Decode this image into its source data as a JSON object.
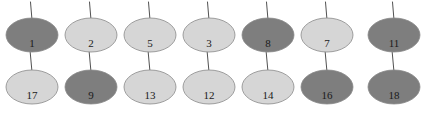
{
  "diagram": {
    "type": "node-graph",
    "canvas": {
      "width": 427,
      "height": 114,
      "background": "#ffffff"
    },
    "colors": {
      "dark_fill": "#7e7e7e",
      "light_fill": "#d6d6d6",
      "node_stroke": "#8a8a8a",
      "edge_stroke": "#3d3d3d",
      "label_color": "#1a1a1a"
    },
    "geometry": {
      "node_rx": 26,
      "node_ry": 17,
      "column_x": [
        32,
        91,
        150,
        209,
        268,
        327,
        394
      ],
      "row_cy": [
        35,
        87
      ]
    },
    "rows": [
      {
        "row_index": 0,
        "nodes": [
          {
            "label": "1",
            "shade": "dark",
            "fill": "#7e7e7e",
            "cx": 32,
            "cy": 35
          },
          {
            "label": "2",
            "shade": "light",
            "fill": "#d6d6d6",
            "cx": 91,
            "cy": 35
          },
          {
            "label": "5",
            "shade": "light",
            "fill": "#d6d6d6",
            "cx": 150,
            "cy": 35
          },
          {
            "label": "3",
            "shade": "light",
            "fill": "#d6d6d6",
            "cx": 209,
            "cy": 35
          },
          {
            "label": "8",
            "shade": "dark",
            "fill": "#7e7e7e",
            "cx": 268,
            "cy": 35
          },
          {
            "label": "7",
            "shade": "light",
            "fill": "#d6d6d6",
            "cx": 327,
            "cy": 35
          },
          {
            "label": "11",
            "shade": "dark",
            "fill": "#7e7e7e",
            "cx": 394,
            "cy": 35
          }
        ]
      },
      {
        "row_index": 1,
        "nodes": [
          {
            "label": "17",
            "shade": "light",
            "fill": "#d6d6d6",
            "cx": 32,
            "cy": 87
          },
          {
            "label": "9",
            "shade": "dark",
            "fill": "#7e7e7e",
            "cx": 91,
            "cy": 87
          },
          {
            "label": "13",
            "shade": "light",
            "fill": "#d6d6d6",
            "cx": 150,
            "cy": 87
          },
          {
            "label": "12",
            "shade": "light",
            "fill": "#d6d6d6",
            "cx": 209,
            "cy": 87
          },
          {
            "label": "14",
            "shade": "light",
            "fill": "#d6d6d6",
            "cx": 268,
            "cy": 87
          },
          {
            "label": "16",
            "shade": "dark",
            "fill": "#7e7e7e",
            "cx": 327,
            "cy": 87
          },
          {
            "label": "18",
            "shade": "dark",
            "fill": "#7e7e7e",
            "cx": 394,
            "cy": 87
          }
        ]
      }
    ],
    "edges": [
      {
        "from": "incoming",
        "to": "1",
        "kind": "top-stub"
      },
      {
        "from": "incoming",
        "to": "2",
        "kind": "top-stub"
      },
      {
        "from": "incoming",
        "to": "5",
        "kind": "top-stub"
      },
      {
        "from": "incoming",
        "to": "3",
        "kind": "top-stub"
      },
      {
        "from": "incoming",
        "to": "8",
        "kind": "top-stub"
      },
      {
        "from": "incoming",
        "to": "7",
        "kind": "top-stub"
      },
      {
        "from": "incoming",
        "to": "11",
        "kind": "top-stub"
      },
      {
        "from": "1",
        "to": "17",
        "kind": "vertical"
      },
      {
        "from": "2",
        "to": "9",
        "kind": "vertical"
      },
      {
        "from": "5",
        "to": "13",
        "kind": "vertical"
      },
      {
        "from": "3",
        "to": "12",
        "kind": "vertical"
      },
      {
        "from": "8",
        "to": "14",
        "kind": "vertical"
      },
      {
        "from": "7",
        "to": "16",
        "kind": "vertical"
      },
      {
        "from": "11",
        "to": "18",
        "kind": "vertical"
      }
    ]
  }
}
